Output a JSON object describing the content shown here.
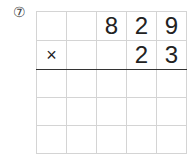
{
  "problem": {
    "number_label": "⑦",
    "rows": [
      [
        "",
        "",
        "8",
        "2",
        "9"
      ],
      [
        "×",
        "",
        "",
        "2",
        "3"
      ],
      [
        "",
        "",
        "",
        "",
        ""
      ],
      [
        "",
        "",
        "",
        "",
        ""
      ],
      [
        "",
        "",
        "",
        "",
        ""
      ]
    ]
  }
}
